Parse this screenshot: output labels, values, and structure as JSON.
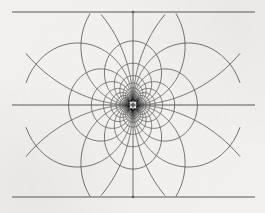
{
  "figure": {
    "type": "conformal-grid",
    "background_color": "#f1f0ee",
    "line_color": "#5b5b5b",
    "axis_color": "#585858",
    "line_width": 0.85,
    "axis_line_width": 1.0
  },
  "chart_data": {
    "type": "line",
    "xlabel": "",
    "ylabel": "",
    "grid": true,
    "legend": false,
    "singularity": {
      "x": 133,
      "y": 105,
      "label": "center"
    },
    "cusps": [
      {
        "x": 133,
        "y": 12,
        "label": "top-cusp"
      },
      {
        "x": 133,
        "y": 197,
        "label": "bottom-cusp"
      }
    ],
    "frame": {
      "left": 12,
      "right": 255,
      "top": 12,
      "bottom": 197,
      "mid_y": 105,
      "grid_left": 25,
      "grid_right": 241
    },
    "axis_lines": [
      {
        "name": "top-border",
        "x1": 12,
        "y1": 12,
        "x2": 255,
        "y2": 12
      },
      {
        "name": "mid-horizontal",
        "x1": 12,
        "y1": 105,
        "x2": 255,
        "y2": 105
      },
      {
        "name": "bottom-border",
        "x1": 12,
        "y1": 197,
        "x2": 255,
        "y2": 197
      }
    ],
    "u_levels": [
      -5,
      -4.2,
      -3.4,
      -2.7,
      -2.1,
      -1.6,
      -1.2,
      -0.85,
      -0.55,
      -0.32,
      -0.15,
      0.15,
      0.32,
      0.55,
      0.85,
      1.2,
      1.6,
      2.1,
      2.7,
      3.4,
      4.2,
      5
    ],
    "v_levels": [
      -4.4,
      -3.6,
      -2.9,
      -2.3,
      -1.8,
      -1.35,
      -0.95,
      -0.62,
      -0.34,
      -0.12,
      0.12,
      0.34,
      0.62,
      0.95,
      1.35,
      1.8,
      2.3,
      2.9,
      3.6,
      4.4
    ],
    "x_range": [
      -3.05,
      3.05
    ],
    "y_range": [
      -2.33,
      2.33
    ],
    "series": [
      {
        "name": "u-family",
        "description": "near-vertical mapped grid lines converging to center",
        "count": 22
      },
      {
        "name": "v-family",
        "description": "near-horizontal mapped grid lines forming circles through center",
        "count": 20
      }
    ]
  }
}
